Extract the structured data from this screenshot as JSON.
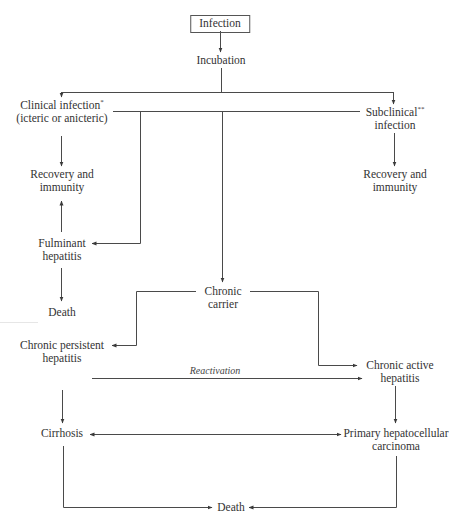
{
  "diagram": {
    "type": "flowchart",
    "nodes": {
      "infection": {
        "label": "Infection"
      },
      "incubation": {
        "label": "Incubation"
      },
      "clinical": {
        "line1": "Clinical infection",
        "sup": "*",
        "line2": "(icteric or anicteric)"
      },
      "subclinical": {
        "line1": "Subclinical",
        "sup": "**",
        "line2": "infection"
      },
      "recovery_left": {
        "line1": "Recovery and",
        "line2": "immunity"
      },
      "recovery_right": {
        "line1": "Recovery and",
        "line2": "immunity"
      },
      "fulminant": {
        "line1": "Fulminant",
        "line2": "hepatitis"
      },
      "death_left": {
        "label": "Death"
      },
      "chronic_carrier": {
        "line1": "Chronic",
        "line2": "carrier"
      },
      "chronic_persistent": {
        "line1": "Chronic persistent",
        "line2": "hepatitis"
      },
      "chronic_active": {
        "line1": "Chronic active",
        "line2": "hepatitis"
      },
      "cirrhosis": {
        "label": "Cirrhosis"
      },
      "primary_hcc": {
        "line1": "Primary hepatocellular",
        "line2": "carcinoma"
      },
      "death_bottom": {
        "label": "Death"
      }
    },
    "edge_labels": {
      "reactivation": "Reactivation"
    },
    "edges": [
      {
        "from": "Infection",
        "to": "Incubation"
      },
      {
        "from": "Incubation",
        "to": "Clinical infection"
      },
      {
        "from": "Incubation",
        "to": "Subclinical infection"
      },
      {
        "from": "Incubation",
        "to": "Fulminant hepatitis"
      },
      {
        "from": "Incubation",
        "to": "Chronic carrier"
      },
      {
        "from": "Clinical infection",
        "to": "Recovery and immunity"
      },
      {
        "from": "Subclinical infection",
        "to": "Recovery and immunity"
      },
      {
        "from": "Fulminant hepatitis",
        "to": "Recovery and immunity"
      },
      {
        "from": "Fulminant hepatitis",
        "to": "Death"
      },
      {
        "from": "Chronic carrier",
        "to": "Chronic persistent hepatitis"
      },
      {
        "from": "Chronic carrier",
        "to": "Chronic active hepatitis"
      },
      {
        "from": "Chronic persistent hepatitis",
        "to": "Chronic active hepatitis",
        "label": "Reactivation"
      },
      {
        "from": "Chronic persistent hepatitis",
        "to": "Cirrhosis"
      },
      {
        "from": "Chronic active hepatitis",
        "to": "Primary hepatocellular carcinoma"
      },
      {
        "from": "Cirrhosis",
        "to": "Primary hepatocellular carcinoma",
        "bidirectional": true
      },
      {
        "from": "Cirrhosis",
        "to": "Death"
      },
      {
        "from": "Primary hepatocellular carcinoma",
        "to": "Death"
      }
    ],
    "colors": {
      "line": "#4a4a4a",
      "text": "#333333",
      "background": "#ffffff"
    }
  }
}
